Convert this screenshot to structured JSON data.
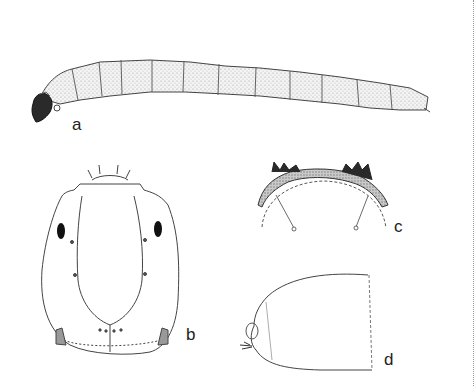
{
  "figure": {
    "panels": [
      {
        "id": "a",
        "label": "a",
        "subject": "larva-lateral-view",
        "segments": 12
      },
      {
        "id": "b",
        "label": "b",
        "subject": "head-capsule-dorsal-view"
      },
      {
        "id": "c",
        "label": "c",
        "subject": "mentum-labrum-detail"
      },
      {
        "id": "d",
        "label": "d",
        "subject": "terminal-abdominal-segment"
      }
    ],
    "colors": {
      "line": "#3a3a3a",
      "stipple": "#bdbdbd",
      "dark_sclerite": "#2a2a2a",
      "background": "#ffffff",
      "divider": "#999999"
    }
  }
}
